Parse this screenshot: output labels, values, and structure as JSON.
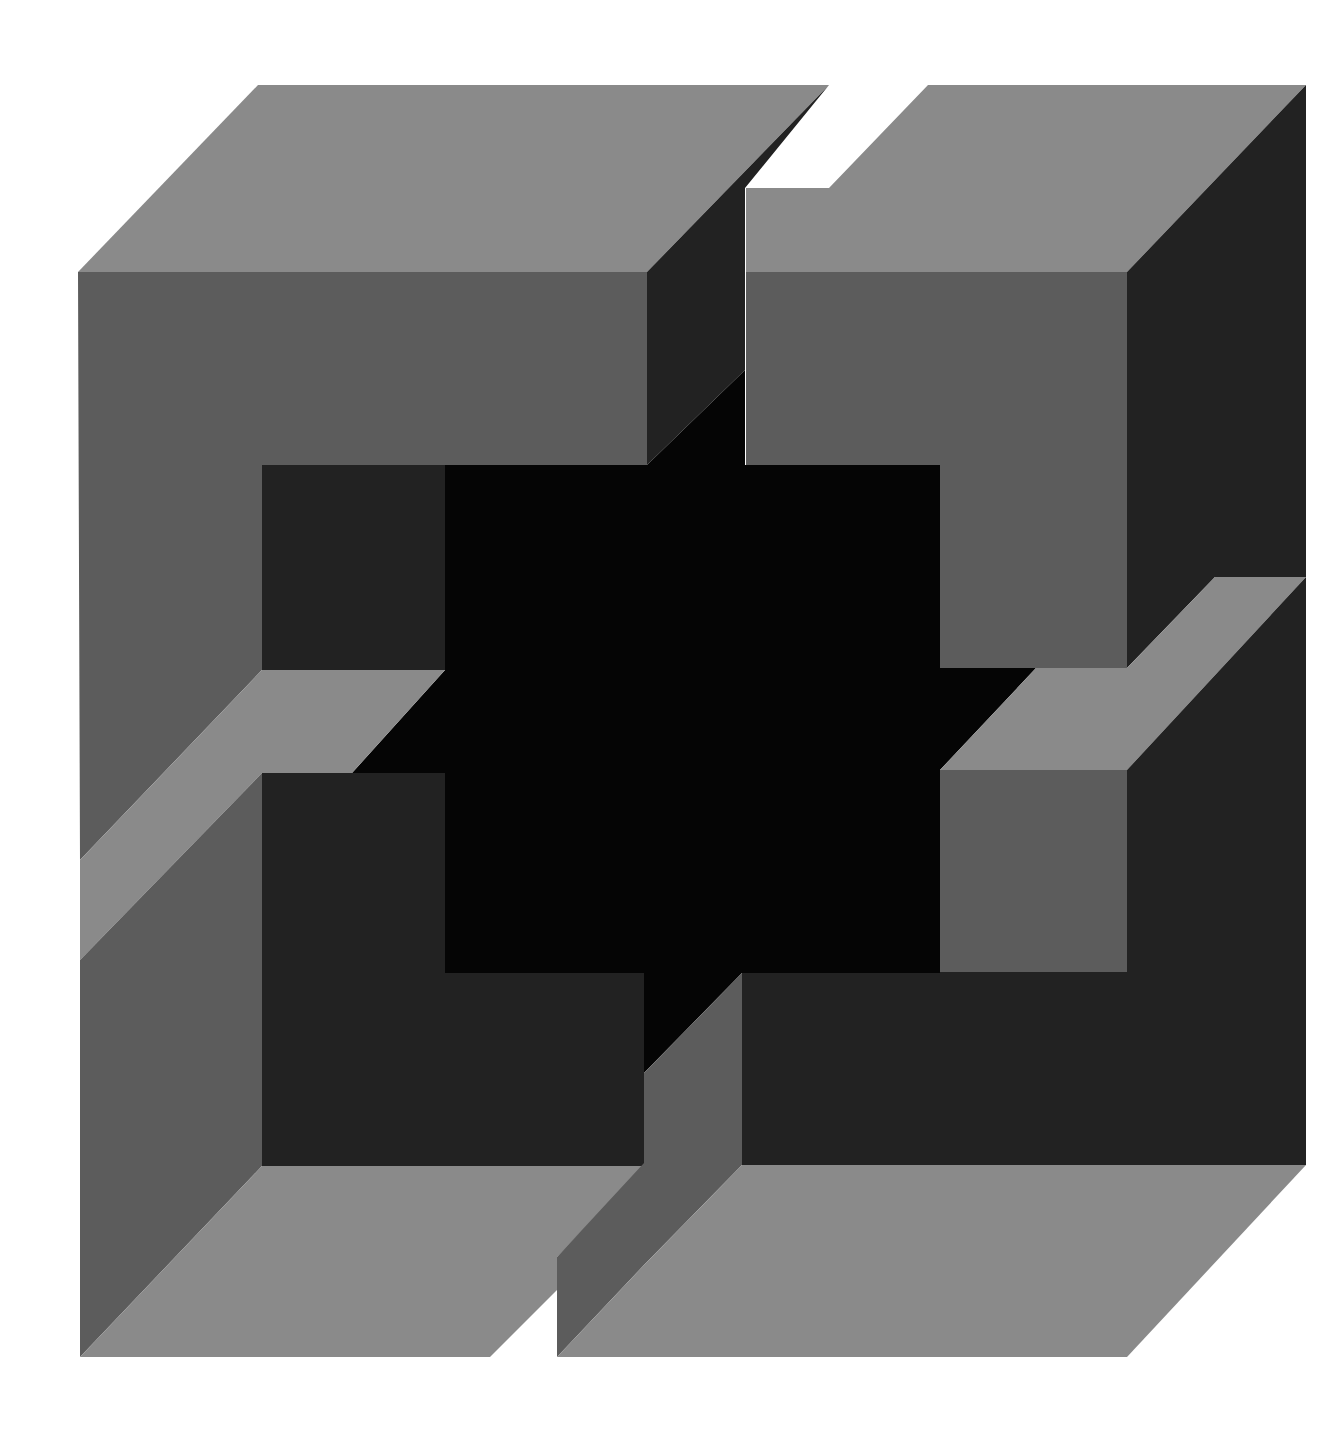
{
  "artwork": {
    "title": "Geometric op-art composition of interlocking cubes",
    "background": "#ffffff",
    "colors": {
      "light": "#8a8a8a",
      "mid": "#5c5c5c",
      "dark": "#222222",
      "black": "#050505",
      "white": "#ffffff"
    },
    "shapes": [
      {
        "name": "tl-top-face",
        "fill": "light",
        "points": "258,85 829,85 647,272 78,272"
      },
      {
        "name": "tl-front-face",
        "fill": "mid",
        "points": "78,272 647,272 647,465 262,465 262,670 80,860"
      },
      {
        "name": "tl-right-face",
        "fill": "dark",
        "points": "829,85 647,272 647,465 745,370 745,188"
      },
      {
        "name": "tr-top-face",
        "fill": "light",
        "points": "928,85 1306,85 1127,272 746,272 746,188 829,188"
      },
      {
        "name": "tr-front-face",
        "fill": "mid",
        "points": "746,272 1127,272 1127,668 940,668 940,465 746,465"
      },
      {
        "name": "tr-right-face",
        "fill": "dark",
        "points": "1306,85 1306,577 1215,577 1127,668 1127,272"
      },
      {
        "name": "center-black",
        "fill": "black",
        "points": "647,465 745,370 745,465 940,465 940,668 1036,668 940,770 940,973 742,973 644,1073 644,973 445,973 445,773 352,773 445,670 445,465"
      },
      {
        "name": "tl-hole-back",
        "fill": "dark",
        "points": "262,465 445,465 445,670 262,670"
      },
      {
        "name": "left-band",
        "fill": "light",
        "points": "262,670 445,670 352,773 262,773 80,960 80,860"
      },
      {
        "name": "bl-front-face",
        "fill": "mid",
        "points": "80,960 262,773 262,1166 80,1357"
      },
      {
        "name": "bl-hole-back",
        "fill": "dark",
        "points": "262,773 445,773 445,973 644,973 644,1166 262,1166"
      },
      {
        "name": "bl-bottom-face",
        "fill": "light",
        "points": "80,1357 262,1166 644,1166 557,1257 557,1290 490,1357"
      },
      {
        "name": "tr-hole-front",
        "fill": "mid",
        "points": "940,770 1127,770 1127,972 940,972"
      },
      {
        "name": "right-band",
        "fill": "light",
        "points": "1036,668 1127,668 1215,577 1306,577 1127,770 940,770"
      },
      {
        "name": "br-back-face",
        "fill": "dark",
        "points": "1306,577 1306,1165 742,1165 742,973 940,973 940,972 1127,972 1127,770"
      },
      {
        "name": "br-left-face",
        "fill": "mid",
        "points": "742,973 742,1165 644,1265 557,1357 557,1257 644,1163 644,1073"
      },
      {
        "name": "br-bottom-face",
        "fill": "light",
        "points": "742,1165 1306,1165 1127,1357 557,1357 644,1265"
      }
    ]
  }
}
